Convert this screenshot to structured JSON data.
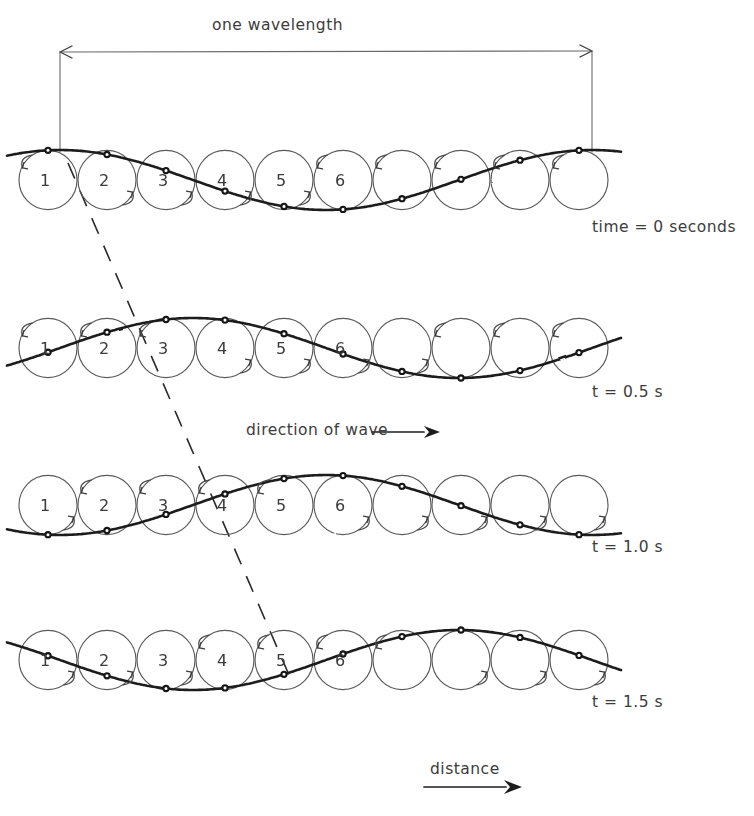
{
  "figure": {
    "style": "hand-drawn pencil sketch",
    "ink_color": "#2b2b2b",
    "background_color": "#ffffff"
  },
  "annotations": {
    "wavelength_label": "one  wavelength",
    "direction_label": "direction  of  wave",
    "distance_label": "distance",
    "direction_arrow": "arrow-right",
    "distance_arrow": "arrow-right",
    "wavelength_arrow": "double-headed-arrow"
  },
  "rows": [
    {
      "id": "row-t0",
      "time_label": "time = 0 seconds",
      "phase_steps": 0,
      "particle_numbers": [
        "1",
        "2",
        "3",
        "4",
        "5",
        "6"
      ]
    },
    {
      "id": "row-t05",
      "time_label": "t = 0.5 s",
      "phase_steps": 1,
      "particle_numbers": [
        "1",
        "2",
        "3",
        "4",
        "5",
        "6"
      ]
    },
    {
      "id": "row-t10",
      "time_label": "t = 1.0 s",
      "phase_steps": 2,
      "particle_numbers": [
        "1",
        "2",
        "3",
        "4",
        "5",
        "6"
      ]
    },
    {
      "id": "row-t15",
      "time_label": "t = 1.5 s",
      "phase_steps": 3,
      "particle_numbers": [
        "1",
        "2",
        "3",
        "4",
        "5",
        "6"
      ]
    }
  ],
  "chart_data": {
    "type": "line",
    "xlabel": "distance",
    "ylabel": "displacement",
    "grid": false,
    "legend": "none",
    "wavelength_px": 532,
    "wavelength_start_x": 60,
    "wavelength_end_x": 592,
    "circle_count_per_row": 10,
    "circle_first_center_x": 48,
    "circle_spacing_px": 59,
    "circle_radius_px": 29,
    "amplitude_px": 30,
    "period_s": 2.0,
    "frame_interval_s": 0.5,
    "row_baselines_y": [
      180,
      348,
      505,
      660
    ],
    "series": [
      {
        "name": "time = 0 seconds",
        "time_s": 0,
        "phase_offset_cycles": 0.0,
        "x": [
          48,
          107,
          166,
          225,
          284,
          343,
          402,
          461,
          520,
          579
        ],
        "y": [
          30,
          24,
          9,
          -9,
          -24,
          -30,
          -24,
          -9,
          9,
          24
        ]
      },
      {
        "name": "t = 0.5 s",
        "time_s": 0.5,
        "phase_offset_cycles": 0.1,
        "x": [
          48,
          107,
          166,
          225,
          284,
          343,
          402,
          461,
          520,
          579
        ],
        "y": [
          24,
          30,
          24,
          9,
          -9,
          -24,
          -30,
          -24,
          -9,
          9
        ]
      },
      {
        "name": "t = 1.0 s",
        "time_s": 1.0,
        "phase_offset_cycles": 0.2,
        "x": [
          48,
          107,
          166,
          225,
          284,
          343,
          402,
          461,
          520,
          579
        ],
        "y": [
          9,
          24,
          30,
          24,
          9,
          -9,
          -24,
          -30,
          -24,
          -9
        ]
      },
      {
        "name": "t = 1.5 s",
        "time_s": 1.5,
        "phase_offset_cycles": 0.3,
        "x": [
          48,
          107,
          166,
          225,
          284,
          343,
          402,
          461,
          520,
          579
        ],
        "y": [
          -9,
          9,
          24,
          30,
          24,
          9,
          -9,
          -24,
          -30,
          -24
        ]
      }
    ],
    "annotations": [
      {
        "text": "one  wavelength",
        "type": "dimension",
        "from_x": 60,
        "to_x": 592
      },
      {
        "text": "direction  of  wave",
        "type": "arrow-label",
        "direction": "right"
      },
      {
        "text": "distance",
        "type": "axis-arrow",
        "direction": "right"
      },
      {
        "text": "crest-trace",
        "type": "dashed-diagonal",
        "from": [
          68,
          163
        ],
        "to": [
          292,
          682
        ]
      }
    ]
  }
}
